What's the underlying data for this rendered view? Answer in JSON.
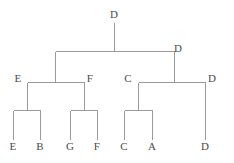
{
  "figure": {
    "title": "",
    "width": 234,
    "height": 163,
    "background_color": "#ffffff",
    "line_color": "#9a9a9a",
    "label_color": "#4a4a4a",
    "line_width": 1
  },
  "chart_data": {
    "type": "tree",
    "orientation": "top-down",
    "title": "",
    "xlabel": "",
    "ylabel": "",
    "grid": false,
    "legend": null,
    "levels": 4,
    "labels_visible": [
      "D",
      "D",
      "E",
      "F",
      "C",
      "D",
      "E",
      "B",
      "G",
      "F",
      "C",
      "A",
      "D"
    ],
    "leaves": [
      "E",
      "B",
      "G",
      "F",
      "C",
      "A",
      "D"
    ],
    "nodes": [
      {
        "id": "root",
        "label": "D",
        "x": 114,
        "y": 14,
        "level": 0
      },
      {
        "id": "n-right",
        "label": "D",
        "x": 178,
        "y": 48,
        "level": 1
      },
      {
        "id": "n-e",
        "label": "E",
        "x": 18,
        "y": 78,
        "level": 2
      },
      {
        "id": "n-f",
        "label": "F",
        "x": 90,
        "y": 78,
        "level": 2
      },
      {
        "id": "n-c",
        "label": "C",
        "x": 128,
        "y": 78,
        "level": 2
      },
      {
        "id": "n-d2",
        "label": "D",
        "x": 212,
        "y": 78,
        "level": 2
      },
      {
        "id": "leaf-e",
        "label": "E",
        "x": 13,
        "y": 146,
        "level": 3
      },
      {
        "id": "leaf-b",
        "label": "B",
        "x": 40,
        "y": 146,
        "level": 3
      },
      {
        "id": "leaf-g",
        "label": "G",
        "x": 70,
        "y": 146,
        "level": 3
      },
      {
        "id": "leaf-f",
        "label": "F",
        "x": 97,
        "y": 146,
        "level": 3
      },
      {
        "id": "leaf-c",
        "label": "C",
        "x": 124,
        "y": 146,
        "level": 3
      },
      {
        "id": "leaf-a",
        "label": "A",
        "x": 152,
        "y": 146,
        "level": 3
      },
      {
        "id": "leaf-d",
        "label": "D",
        "x": 205,
        "y": 146,
        "level": 3
      }
    ],
    "edges": [
      {
        "from": "root",
        "to": "bar-l1",
        "type": "stem",
        "x1": 114,
        "y1": 22,
        "x2": 114,
        "y2": 51
      },
      {
        "from": "l1",
        "to": "l1",
        "type": "horizontal",
        "x1": 55,
        "y1": 51,
        "x2": 174,
        "y2": 51
      },
      {
        "from": "l1",
        "to": "left",
        "type": "stem",
        "x1": 55,
        "y1": 51,
        "x2": 55,
        "y2": 82
      },
      {
        "from": "l1",
        "to": "right",
        "type": "stem",
        "x1": 174,
        "y1": 51,
        "x2": 174,
        "y2": 82
      },
      {
        "from": "l2left",
        "to": "l2left",
        "type": "horizontal",
        "x1": 27,
        "y1": 82,
        "x2": 84,
        "y2": 82
      },
      {
        "from": "l2left",
        "to": "n-e",
        "type": "stem",
        "x1": 27,
        "y1": 82,
        "x2": 27,
        "y2": 110
      },
      {
        "from": "l2left",
        "to": "n-f",
        "type": "stem",
        "x1": 84,
        "y1": 82,
        "x2": 84,
        "y2": 110
      },
      {
        "from": "l2right",
        "to": "l2right",
        "type": "horizontal",
        "x1": 138,
        "y1": 82,
        "x2": 205,
        "y2": 82
      },
      {
        "from": "l2right",
        "to": "n-c",
        "type": "stem",
        "x1": 138,
        "y1": 82,
        "x2": 138,
        "y2": 110
      },
      {
        "from": "l2right",
        "to": "n-d2",
        "type": "stem",
        "x1": 205,
        "y1": 82,
        "x2": 205,
        "y2": 139
      },
      {
        "from": "be",
        "to": "be",
        "type": "horizontal",
        "x1": 13,
        "y1": 110,
        "x2": 40,
        "y2": 110
      },
      {
        "from": "be",
        "to": "leaf-e",
        "type": "stem",
        "x1": 13,
        "y1": 110,
        "x2": 13,
        "y2": 139
      },
      {
        "from": "be",
        "to": "leaf-b",
        "type": "stem",
        "x1": 40,
        "y1": 110,
        "x2": 40,
        "y2": 139
      },
      {
        "from": "bf",
        "to": "bf",
        "type": "horizontal",
        "x1": 70,
        "y1": 110,
        "x2": 97,
        "y2": 110
      },
      {
        "from": "bf",
        "to": "leaf-g",
        "type": "stem",
        "x1": 70,
        "y1": 110,
        "x2": 70,
        "y2": 139
      },
      {
        "from": "bf",
        "to": "leaf-f",
        "type": "stem",
        "x1": 97,
        "y1": 110,
        "x2": 97,
        "y2": 139
      },
      {
        "from": "bc",
        "to": "bc",
        "type": "horizontal",
        "x1": 124,
        "y1": 110,
        "x2": 152,
        "y2": 110
      },
      {
        "from": "bc",
        "to": "leaf-c",
        "type": "stem",
        "x1": 124,
        "y1": 110,
        "x2": 124,
        "y2": 139
      },
      {
        "from": "bc",
        "to": "leaf-a",
        "type": "stem",
        "x1": 152,
        "y1": 110,
        "x2": 152,
        "y2": 139
      }
    ]
  }
}
